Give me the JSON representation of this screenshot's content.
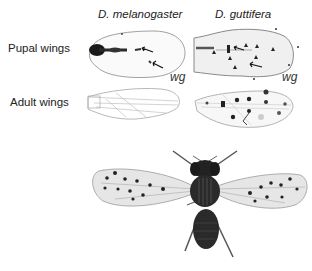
{
  "figure": {
    "columns": [
      {
        "species": "D. melanogaster"
      },
      {
        "species": "D. guttifera"
      }
    ],
    "rows": [
      {
        "label": "Pupal wings"
      },
      {
        "label": "Adult wings"
      }
    ],
    "gene_label": "wg",
    "panels": {
      "pupal_melanogaster_gene": "wg",
      "pupal_guttifera_gene": "wg"
    },
    "colors": {
      "stain": "#1a1a1a",
      "wing_outline": "#9a9a9a",
      "background": "#ffffff"
    }
  }
}
